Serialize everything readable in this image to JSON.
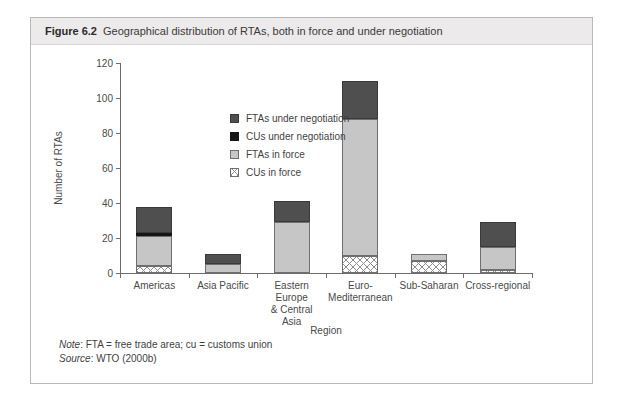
{
  "figure": {
    "label": "Figure 6.2",
    "title": "Geographical distribution of RTAs, both in force and under negotiation"
  },
  "notes": {
    "note_label": "Note",
    "note_text": ": FTA = free trade area; cu = customs union",
    "source_label": "Source",
    "source_text": ": WTO (2000b)"
  },
  "colors": {
    "fta_under_negotiation": "#4f4f4f",
    "cus_under_negotiation": "#161616",
    "ftas_in_force": "#c6c6c6",
    "cus_in_force": "#ffffff",
    "axis": "#6d6d6d",
    "title_bar": "#eceaea",
    "card_border": "#b9b9b9"
  },
  "chart_data": {
    "type": "bar",
    "stacked": true,
    "title": "Geographical distribution of RTAs, both in force and under negotiation",
    "xlabel": "Region",
    "ylabel": "Number of RTAs",
    "ylim": [
      0,
      120
    ],
    "yticks": [
      0,
      20,
      40,
      60,
      80,
      100,
      120
    ],
    "grid": false,
    "legend_position": "upper-left-inside",
    "categories": [
      "Americas",
      "Asia Pacific",
      "Eastern Europe & Central Asia",
      "Euro-Mediterranean",
      "Sub-Saharan",
      "Cross-regional"
    ],
    "category_label_lines": [
      [
        "Americas"
      ],
      [
        "Asia Pacific"
      ],
      [
        "Eastern Europe",
        "& Central",
        "Asia"
      ],
      [
        "Euro-",
        "Mediterranean"
      ],
      [
        "Sub-Saharan"
      ],
      [
        "Cross-regional"
      ]
    ],
    "series": [
      {
        "name": "CUs in force",
        "values": [
          4,
          0,
          0,
          10,
          7,
          2
        ]
      },
      {
        "name": "FTAs in force",
        "values": [
          17,
          5,
          29,
          78,
          4,
          13
        ]
      },
      {
        "name": "CUs under negotiation",
        "values": [
          2,
          0,
          0,
          0,
          0,
          0
        ]
      },
      {
        "name": "FTAs under negotiation",
        "values": [
          15,
          6,
          12,
          22,
          0,
          14
        ]
      }
    ],
    "totals": [
      38,
      11,
      41,
      110,
      11,
      29
    ]
  },
  "legend": {
    "items": [
      {
        "label": "FTAs under negotiation",
        "swatch": "fta-under-negotiation-swatch"
      },
      {
        "label": "CUs under negotiation",
        "swatch": "cus-under-negotiation-swatch"
      },
      {
        "label": "FTAs in force",
        "swatch": "ftas-in-force-swatch"
      },
      {
        "label": "CUs in force",
        "swatch": "cus-in-force-swatch"
      }
    ]
  }
}
